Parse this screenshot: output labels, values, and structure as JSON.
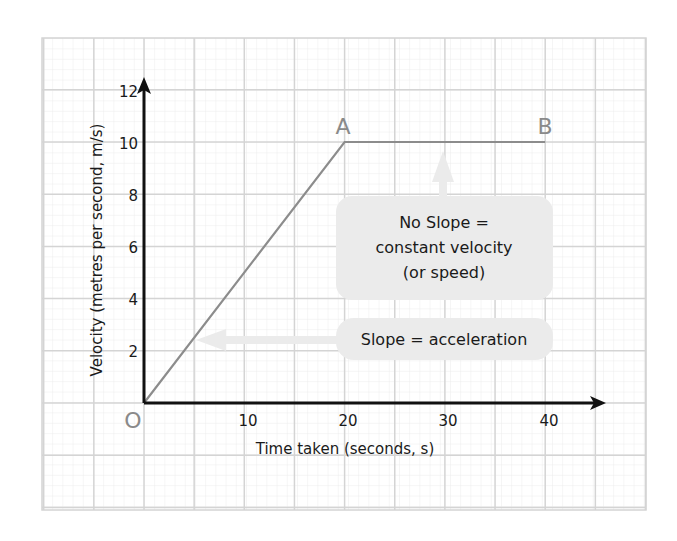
{
  "chart_data": {
    "type": "line",
    "title": "",
    "xlabel": "Time taken (seconds, s)",
    "ylabel": "Velocity (metres per second, m/s)",
    "xlim": [
      0,
      45
    ],
    "ylim": [
      0,
      12
    ],
    "x_ticks": [
      10,
      20,
      30,
      40
    ],
    "y_ticks": [
      2,
      4,
      6,
      8,
      10,
      12
    ],
    "grid": true,
    "series": [
      {
        "name": "velocity-time",
        "x": [
          0,
          20,
          40
        ],
        "y": [
          0,
          10,
          10
        ]
      }
    ],
    "point_labels": [
      {
        "label": "O",
        "x": 0,
        "y": 0
      },
      {
        "label": "A",
        "x": 20,
        "y": 10
      },
      {
        "label": "B",
        "x": 40,
        "y": 10
      }
    ],
    "annotations": [
      {
        "id": "no-slope",
        "lines": [
          "No Slope =",
          "constant velocity",
          "(or speed)"
        ],
        "points_to": "segment A-B"
      },
      {
        "id": "slope",
        "lines": [
          "Slope = acceleration"
        ],
        "points_to": "segment O-A"
      }
    ]
  },
  "labels": {
    "origin": "O",
    "point_a": "A",
    "point_b": "B",
    "x_axis": "Time taken (seconds, s)",
    "y_axis": "Velocity (metres per second, m/s)",
    "xticks": [
      "10",
      "20",
      "30",
      "40"
    ],
    "yticks": [
      "2",
      "4",
      "6",
      "8",
      "10",
      "12"
    ],
    "callout_no_slope": [
      "No Slope =",
      "constant velocity",
      "(or speed)"
    ],
    "callout_slope": "Slope = acceleration"
  },
  "colors": {
    "grid_major": "#d4d4d4",
    "grid_minor": "#ececec",
    "axis": "#111111",
    "line": "#8c8c8c",
    "callout_fill": "#ebebeb",
    "point_label": "#8a8a8a"
  }
}
